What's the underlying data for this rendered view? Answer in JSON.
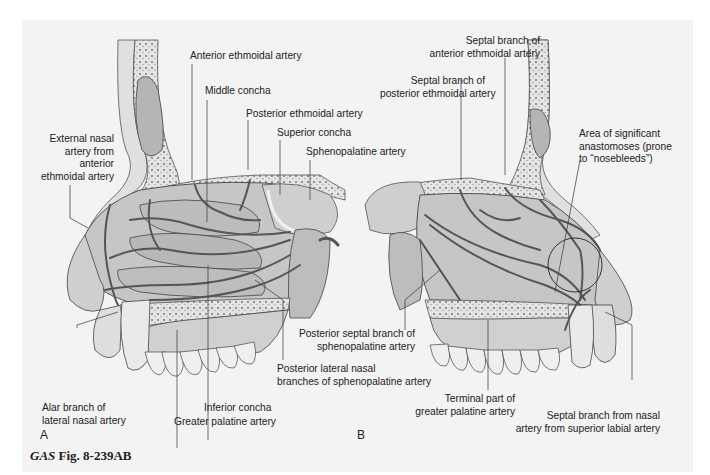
{
  "figure": {
    "caption_prefix": "GAS",
    "caption_suffix": "Fig. 8-239AB",
    "panels": [
      {
        "letter": "A",
        "view": "lateral wall of nasal cavity"
      },
      {
        "letter": "B",
        "view": "nasal septum"
      }
    ],
    "colors": {
      "background": "#ffffff",
      "panel": "#f3f3f3",
      "tissue": "#c8c8c8",
      "bone": "#e6e6e6",
      "artery": "#555555",
      "line": "#333333"
    }
  },
  "panel_a": {
    "labels": {
      "anterior_ethmoidal": "Anterior ethmoidal artery",
      "middle_concha": "Middle concha",
      "posterior_ethmoidal": "Posterior ethmoidal artery",
      "superior_concha": "Superior concha",
      "sphenopalatine": "Sphenopalatine artery",
      "external_nasal": "External nasal\nartery from\nanterior\nethmoidal artery",
      "alar_branch": "Alar branch of\nlateral nasal artery",
      "inferior_concha": "Inferior concha",
      "greater_palatine": "Greater palatine artery",
      "posterior_lateral_nasal": "Posterior lateral nasal\nbranches of sphenopalatine artery"
    }
  },
  "panel_b": {
    "labels": {
      "septal_anterior_ethmoidal": "Septal branch of\nanterior ethmoidal artery",
      "septal_posterior_ethmoidal": "Septal branch of\nposterior ethmoidal artery",
      "anastomoses": "Area of significant\nanastomoses (prone\nto “nosebleeds”)",
      "posterior_septal": "Posterior septal branch of\nsphenopalatine artery",
      "terminal_greater_palatine": "Terminal part of\ngreater palatine artery",
      "septal_superior_labial": "Septal branch from nasal\nartery from superior labial artery"
    }
  }
}
